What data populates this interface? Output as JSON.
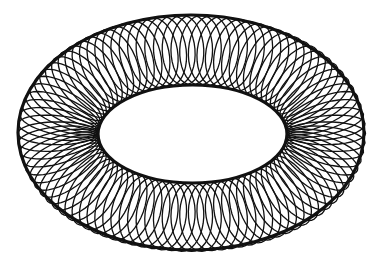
{
  "figure": {
    "width": 379,
    "height": 269,
    "background": "#ffffff",
    "stroke_color": "#111111",
    "outer_ellipse": {
      "cx": 191,
      "cy": 132.5,
      "rx": 173,
      "ry": 117.5
    },
    "inner_ellipse": {
      "cx": 192.5,
      "cy": 134,
      "rx": 94.5,
      "ry": 49
    },
    "loop_count": 96,
    "tilt_deg": 58,
    "loop_stroke_width": 1.3,
    "edge_stroke_width": 3.2
  }
}
